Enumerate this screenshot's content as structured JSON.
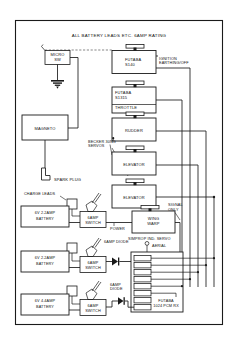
{
  "diagram": {
    "title": "ALL BATTERY LEADS ETC. 6AMP RATING",
    "type": "wiring-schematic"
  },
  "components": {
    "micro_switch": {
      "line1": "MICRO",
      "line2": "SW"
    },
    "magneto": {
      "label": "MAGNETO"
    },
    "spark_plug": {
      "label": "SPARK PLUG"
    },
    "servo_s140": {
      "line1": "FUTABA",
      "line2": "S140"
    },
    "servo_throttle": {
      "line1": "FUTABA",
      "line2": "S1315",
      "line3": "THROTTLE"
    },
    "servo_rudder": {
      "label": "RUDDER"
    },
    "servo_elevator_1": {
      "label": "ELEVATOR"
    },
    "servo_elevator_2": {
      "label": "ELEVATOR"
    },
    "servo_wing_warp": {
      "line1": "WING",
      "line2": "WARP"
    },
    "receiver": {
      "line1": "FUTABA",
      "line2": "1024 PCM RX"
    },
    "battery_1": {
      "line1": "6V 2.2AMP",
      "line2": "BATTERY"
    },
    "battery_2": {
      "line1": "6V 2.2AMP",
      "line2": "BATTERY"
    },
    "battery_3": {
      "line1": "6V 4.4AMP",
      "line2": "BATTERY"
    },
    "switch_1": {
      "line1": "6AMP",
      "line2": "SWITCH"
    },
    "switch_2": {
      "line1": "6AMP",
      "line2": "SWITCH"
    },
    "switch_3": {
      "line1": "6AMP",
      "line2": "SWITCH"
    }
  },
  "annotations": {
    "ignition": {
      "line1": "IGNITION",
      "line2": "EARTHING/OFF"
    },
    "becker_servos": {
      "line1": "BECKER 30NG",
      "line2": "SERVOS"
    },
    "charge_leads": {
      "label": "CHARGE LEADS"
    },
    "simprop": {
      "label": "SIMPROP IND. SERVO"
    },
    "signal_only": {
      "line1": "SIGNAL",
      "line2": "ONLY"
    },
    "power_label": {
      "label": "POWER"
    },
    "diode_1": {
      "line1": "6AMP DIODE"
    },
    "diode_2": {
      "line1": "6AMP",
      "line2": "DIODE"
    },
    "aerial": {
      "label": "AERIAL"
    }
  },
  "colors": {
    "ink": "#1a1a1a",
    "paper": "#ffffff",
    "dash": "#555555"
  }
}
